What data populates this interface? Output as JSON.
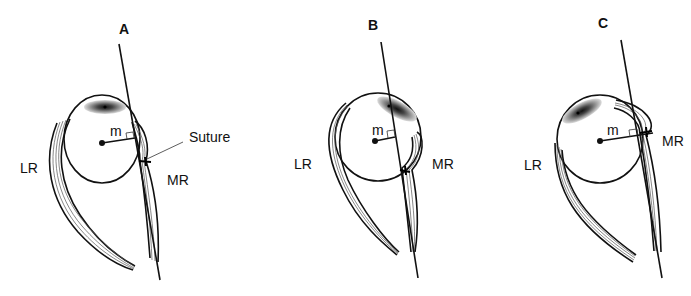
{
  "figure": {
    "panels": [
      {
        "id": "A",
        "label": "A",
        "labels": {
          "lateral": "LR",
          "medial": "MR",
          "moment_arm": "m",
          "callout": "Suture"
        }
      },
      {
        "id": "B",
        "label": "B",
        "labels": {
          "lateral": "LR",
          "medial": "MR",
          "moment_arm": "m"
        }
      },
      {
        "id": "C",
        "label": "C",
        "labels": {
          "lateral": "LR",
          "medial": "MR",
          "moment_arm": "m"
        }
      }
    ]
  },
  "colors": {
    "background": "#ffffff",
    "ink": "#111111",
    "fiber": "#555555"
  }
}
